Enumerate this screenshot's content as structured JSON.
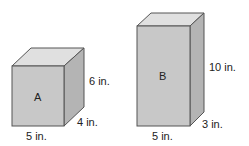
{
  "prisms": [
    {
      "name": "A",
      "length": "5 in.",
      "width": "4 in.",
      "height": "6 in."
    },
    {
      "name": "B",
      "length": "5 in.",
      "width": "3 in.",
      "height": "10 in."
    }
  ],
  "colors": {
    "front": "#c8c8c8",
    "top": "#e0e0e0",
    "side": "#b4b4b4",
    "edge": "#555555"
  }
}
